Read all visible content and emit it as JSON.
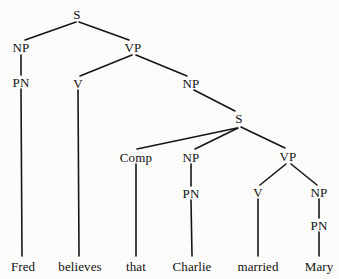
{
  "figure": {
    "kind": "syntactic-parse-tree",
    "sentence": "Fred believes that Charlie married Mary",
    "background_color": "#fbfbfa",
    "line_color": "#161616",
    "text_color": "#121212"
  },
  "nodes": [
    {
      "id": "s-root",
      "label": "S",
      "x": 77,
      "y": 14
    },
    {
      "id": "np-subject",
      "label": "NP",
      "x": 21,
      "y": 47
    },
    {
      "id": "vp-matrix",
      "label": "VP",
      "x": 133,
      "y": 47
    },
    {
      "id": "pn-fred",
      "label": "PN",
      "x": 21,
      "y": 82
    },
    {
      "id": "v-believes",
      "label": "V",
      "x": 78,
      "y": 83
    },
    {
      "id": "np-object",
      "label": "NP",
      "x": 191,
      "y": 83
    },
    {
      "id": "s-embedded",
      "label": "S",
      "x": 239,
      "y": 118
    },
    {
      "id": "comp-that",
      "label": "Comp",
      "x": 136,
      "y": 157
    },
    {
      "id": "np-embedded",
      "label": "NP",
      "x": 191,
      "y": 157
    },
    {
      "id": "vp-embedded",
      "label": "VP",
      "x": 288,
      "y": 156
    },
    {
      "id": "pn-charlie",
      "label": "PN",
      "x": 191,
      "y": 193
    },
    {
      "id": "v-married",
      "label": "V",
      "x": 258,
      "y": 192
    },
    {
      "id": "np-mary",
      "label": "NP",
      "x": 319,
      "y": 192
    },
    {
      "id": "pn-mary",
      "label": "PN",
      "x": 319,
      "y": 225
    }
  ],
  "leaves": [
    {
      "id": "leaf-fred",
      "label": "Fred",
      "x": 23,
      "y": 266
    },
    {
      "id": "leaf-believes",
      "label": "believes",
      "x": 80,
      "y": 266
    },
    {
      "id": "leaf-that",
      "label": "that",
      "x": 136,
      "y": 266
    },
    {
      "id": "leaf-charlie",
      "label": "Charlie",
      "x": 192,
      "y": 266
    },
    {
      "id": "leaf-married",
      "label": "married",
      "x": 258,
      "y": 266
    },
    {
      "id": "leaf-mary",
      "label": "Mary",
      "x": 319,
      "y": 266
    }
  ],
  "edges": [
    {
      "id": "edge-s-np",
      "from": "s-root",
      "to": "np-subject",
      "x1": 76,
      "y1": 22,
      "x2": 25,
      "y2": 40
    },
    {
      "id": "edge-s-vp",
      "from": "s-root",
      "to": "vp-matrix",
      "x1": 79,
      "y1": 22,
      "x2": 129,
      "y2": 40
    },
    {
      "id": "edge-np-pn-fred",
      "from": "np-subject",
      "to": "pn-fred",
      "x1": 21,
      "y1": 55,
      "x2": 21,
      "y2": 75
    },
    {
      "id": "edge-vp-v",
      "from": "vp-matrix",
      "to": "v-believes",
      "x1": 132,
      "y1": 55,
      "x2": 80,
      "y2": 76
    },
    {
      "id": "edge-vp-np",
      "from": "vp-matrix",
      "to": "np-object",
      "x1": 136,
      "y1": 55,
      "x2": 187,
      "y2": 76
    },
    {
      "id": "edge-pn-fred-leaf",
      "from": "pn-fred",
      "to": "leaf-fred",
      "x1": 21,
      "y1": 89,
      "x2": 22,
      "y2": 256
    },
    {
      "id": "edge-v-believes-leaf",
      "from": "v-believes",
      "to": "leaf-believes",
      "x1": 78,
      "y1": 90,
      "x2": 79,
      "y2": 256
    },
    {
      "id": "edge-np-s",
      "from": "np-object",
      "to": "s-embedded",
      "x1": 194,
      "y1": 90,
      "x2": 235,
      "y2": 111
    },
    {
      "id": "edge-s-comp",
      "from": "s-embedded",
      "to": "comp-that",
      "x1": 237,
      "y1": 128,
      "x2": 137,
      "y2": 149
    },
    {
      "id": "edge-s-np-embedded",
      "from": "s-embedded",
      "to": "np-embedded",
      "x1": 238,
      "y1": 128,
      "x2": 195,
      "y2": 149
    },
    {
      "id": "edge-s-vp-embedded",
      "from": "s-embedded",
      "to": "vp-embedded",
      "x1": 241,
      "y1": 127,
      "x2": 285,
      "y2": 148
    },
    {
      "id": "edge-comp-leaf",
      "from": "comp-that",
      "to": "leaf-that",
      "x1": 136,
      "y1": 164,
      "x2": 136,
      "y2": 256
    },
    {
      "id": "edge-np-pn-charlie",
      "from": "np-embedded",
      "to": "pn-charlie",
      "x1": 191,
      "y1": 164,
      "x2": 191,
      "y2": 186
    },
    {
      "id": "edge-pn-charlie-leaf",
      "from": "pn-charlie",
      "to": "leaf-charlie",
      "x1": 191,
      "y1": 200,
      "x2": 192,
      "y2": 256
    },
    {
      "id": "edge-vp-v-married",
      "from": "vp-embedded",
      "to": "v-married",
      "x1": 286,
      "y1": 164,
      "x2": 260,
      "y2": 185
    },
    {
      "id": "edge-vp-np-mary",
      "from": "vp-embedded",
      "to": "np-mary",
      "x1": 291,
      "y1": 164,
      "x2": 317,
      "y2": 185
    },
    {
      "id": "edge-v-married-leaf",
      "from": "v-married",
      "to": "leaf-married",
      "x1": 258,
      "y1": 199,
      "x2": 258,
      "y2": 256
    },
    {
      "id": "edge-np-pn-mary",
      "from": "np-mary",
      "to": "pn-mary",
      "x1": 319,
      "y1": 199,
      "x2": 319,
      "y2": 218
    },
    {
      "id": "edge-pn-mary-leaf",
      "from": "pn-mary",
      "to": "leaf-mary",
      "x1": 319,
      "y1": 232,
      "x2": 319,
      "y2": 256
    }
  ]
}
